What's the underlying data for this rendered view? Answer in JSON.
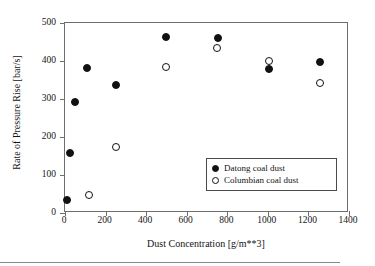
{
  "chart_data": {
    "type": "scatter",
    "title": "",
    "xlabel": "Dust Concentration [g/m**3]",
    "ylabel": "Rate of Pressure Rise [bar/s]",
    "xlim": [
      0,
      1400
    ],
    "ylim": [
      0,
      500
    ],
    "xticks": [
      0,
      200,
      400,
      600,
      800,
      1000,
      1200,
      1400
    ],
    "yticks": [
      0,
      100,
      200,
      300,
      400,
      500
    ],
    "xticklabels": [
      "0",
      "200",
      "400",
      "600",
      "800",
      "1000",
      "1200",
      "1400"
    ],
    "yticklabels": [
      "0",
      "100",
      "200",
      "300",
      "400",
      "500"
    ],
    "grid": false,
    "legend_position": "lower right",
    "series": [
      {
        "name": "Datong coal dust",
        "marker": "filled-circle",
        "color": "#111111",
        "points": [
          {
            "x": 10,
            "y": 33
          },
          {
            "x": 25,
            "y": 158
          },
          {
            "x": 50,
            "y": 292
          },
          {
            "x": 110,
            "y": 381
          },
          {
            "x": 250,
            "y": 338
          },
          {
            "x": 500,
            "y": 462
          },
          {
            "x": 755,
            "y": 460
          },
          {
            "x": 1005,
            "y": 378
          },
          {
            "x": 1255,
            "y": 398
          }
        ]
      },
      {
        "name": "Columbian coal dust",
        "marker": "open-circle",
        "color": "#111111",
        "points": [
          {
            "x": 120,
            "y": 47
          },
          {
            "x": 250,
            "y": 175
          },
          {
            "x": 500,
            "y": 385
          },
          {
            "x": 750,
            "y": 433
          },
          {
            "x": 1005,
            "y": 401
          },
          {
            "x": 1255,
            "y": 342
          }
        ]
      }
    ]
  },
  "legend": {
    "entries": [
      {
        "label": "Datong coal dust",
        "marker": "filled-circle"
      },
      {
        "label": "Columbian coal dust",
        "marker": "open-circle"
      }
    ]
  }
}
